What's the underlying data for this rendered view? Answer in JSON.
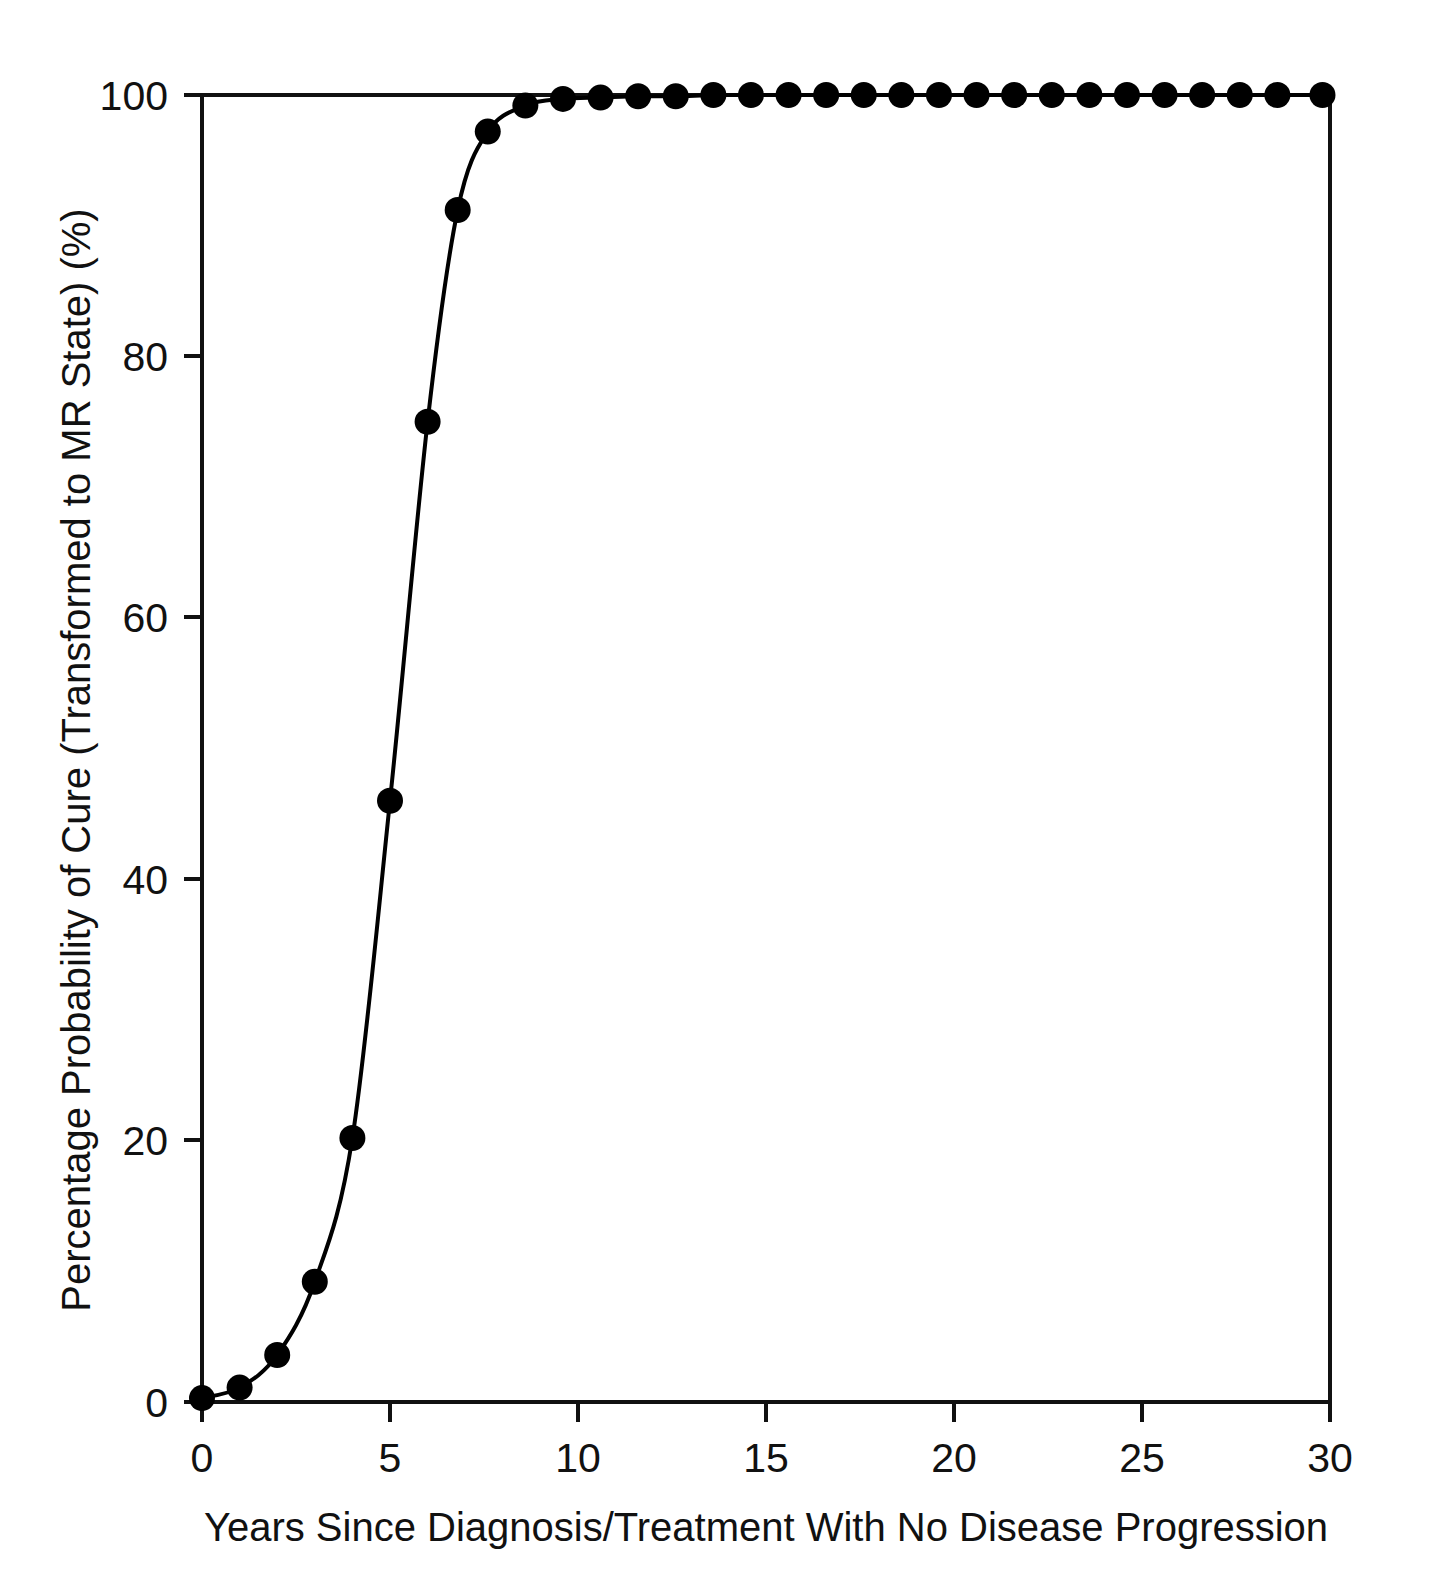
{
  "chart_data": {
    "type": "line",
    "title": "",
    "xlabel": "Years Since Diagnosis/Treatment With No Disease Progression",
    "ylabel": "Percentage Probability of Cure (Transformed to MR State) (%)",
    "xlim": [
      0,
      30
    ],
    "ylim": [
      0,
      100
    ],
    "xticks": [
      0,
      5,
      10,
      15,
      20,
      25,
      30
    ],
    "xtick_labels": [
      "0",
      "5",
      "10",
      "15",
      "20",
      "25",
      "30"
    ],
    "yticks": [
      0,
      20,
      40,
      60,
      80,
      100
    ],
    "ytick_labels": [
      "0",
      "20",
      "40",
      "60",
      "80",
      "100"
    ],
    "grid": false,
    "legend": false,
    "marker": "filled-circle",
    "marker_color": "#000000",
    "line_color": "#000000",
    "frame": "box",
    "x": [
      0,
      1,
      2,
      3,
      4,
      5,
      6,
      6.8,
      7.6,
      8.6,
      9.6,
      10.6,
      11.6,
      12.6,
      13.6,
      14.6,
      15.6,
      16.6,
      17.6,
      18.6,
      19.6,
      20.6,
      21.6,
      22.6,
      23.6,
      24.6,
      25.6,
      26.6,
      27.6,
      28.6,
      29.8
    ],
    "values": [
      0.3,
      1.1,
      3.6,
      9.2,
      20.2,
      46.0,
      75.0,
      91.2,
      97.2,
      99.2,
      99.7,
      99.8,
      99.9,
      99.9,
      100.0,
      100.0,
      100.0,
      100.0,
      100.0,
      100.0,
      100.0,
      100.0,
      100.0,
      100.0,
      100.0,
      100.0,
      100.0,
      100.0,
      100.0,
      100.0,
      100.0
    ]
  },
  "axes": {
    "x_title": "Years Since Diagnosis/Treatment With No Disease Progression",
    "y_title": "Percentage Probability of Cure (Transformed to MR State) (%)",
    "x_tick_0": "0",
    "x_tick_1": "5",
    "x_tick_2": "10",
    "x_tick_3": "15",
    "x_tick_4": "20",
    "x_tick_5": "25",
    "x_tick_6": "30",
    "y_tick_0": "0",
    "y_tick_1": "20",
    "y_tick_2": "40",
    "y_tick_3": "60",
    "y_tick_4": "80",
    "y_tick_5": "100"
  },
  "colors": {
    "line": "#000000",
    "marker": "#000000",
    "axis": "#111111",
    "background": "#ffffff"
  }
}
